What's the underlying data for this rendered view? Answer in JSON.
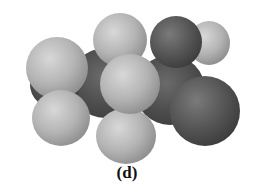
{
  "figure": {
    "caption": "(d)",
    "colors": {
      "hydrogen": "#b4b4b4",
      "oxygen": "#555555",
      "carbon": "#4d4d4d",
      "background": "#ffffff"
    }
  }
}
